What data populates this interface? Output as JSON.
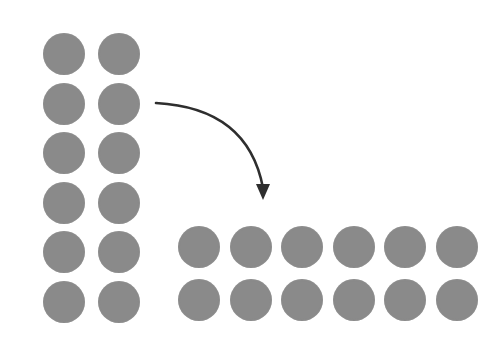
{
  "diagram": {
    "dot_color": "#8a8a8a",
    "arrow_color": "#2e2e2e",
    "dot_diameter": 42,
    "source_array": {
      "rows": 6,
      "cols": 2,
      "col_centers_x": [
        64,
        119
      ],
      "row_centers_y": [
        54,
        104,
        153,
        203,
        252,
        302
      ]
    },
    "target_array": {
      "rows": 2,
      "cols": 6,
      "col_centers_x": [
        199,
        251,
        302,
        354,
        405,
        457
      ],
      "row_centers_y": [
        247,
        300
      ]
    },
    "arrow": {
      "start": [
        156,
        103
      ],
      "control": [
        248,
        108
      ],
      "end": [
        263,
        188
      ],
      "tip": [
        263,
        200
      ],
      "direction": "curved-down-right"
    }
  }
}
